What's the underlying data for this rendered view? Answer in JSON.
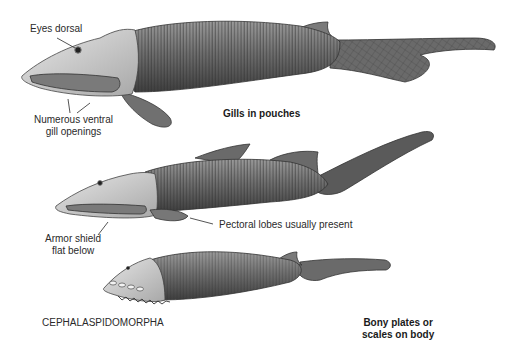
{
  "figure": {
    "class_label": "CEPHALASPIDOMORPHA",
    "annotations": {
      "eyes_dorsal": "Eyes dorsal",
      "ventral_gills_line1": "Numerous ventral",
      "ventral_gills_line2": "gill openings",
      "gills_in_pouches": "Gills in pouches",
      "pectoral_lobes": "Pectoral lobes usually present",
      "armor_shield_line1": "Armor shield",
      "armor_shield_line2": "flat below",
      "bony_plates_line1": "Bony plates or",
      "bony_plates_line2": "scales on body"
    },
    "specimens": [
      {
        "name": "top-fish",
        "description": "Jawless fish with gills in pouches, large ventral mouth shield, paired lobe fin"
      },
      {
        "name": "middle-fish",
        "description": "Jawless fish with pectoral lobes and flat ventral armor shield"
      },
      {
        "name": "bottom-fish",
        "description": "Armored fish with bony plates, ventral gill openings and serrated margin"
      }
    ],
    "colors": {
      "ink": "#2a2a2a",
      "body_dark": "#5a5a5a",
      "body_mid": "#8c8c8c",
      "head_light": "#d4d4d4"
    }
  }
}
